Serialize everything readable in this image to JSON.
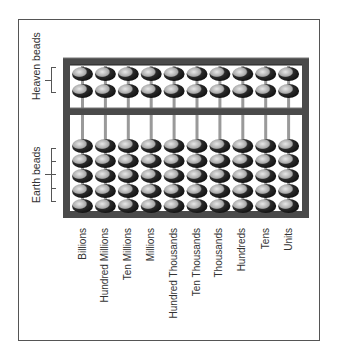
{
  "diagram": {
    "type": "abacus (suanpan/soroban style)",
    "side_labels": {
      "heaven": "Heaven beads",
      "earth": "Earth beads"
    },
    "columns": [
      {
        "label": "Billions"
      },
      {
        "label": "Hundred Millions"
      },
      {
        "label": "Ten Millions"
      },
      {
        "label": "Millions"
      },
      {
        "label": "Hundred Thousands"
      },
      {
        "label": "Ten Thousands"
      },
      {
        "label": "Thousands"
      },
      {
        "label": "Hundreds"
      },
      {
        "label": "Tens"
      },
      {
        "label": "Units"
      }
    ],
    "heaven_beads_per_rod": 2,
    "earth_beads_per_rod": 5,
    "colors": {
      "frame": "#4a4a4a",
      "bead_dark": "#2a2a2a",
      "bead_light": "#cfcfcf",
      "rod": "#9a9a9a",
      "border": "#555555"
    }
  }
}
